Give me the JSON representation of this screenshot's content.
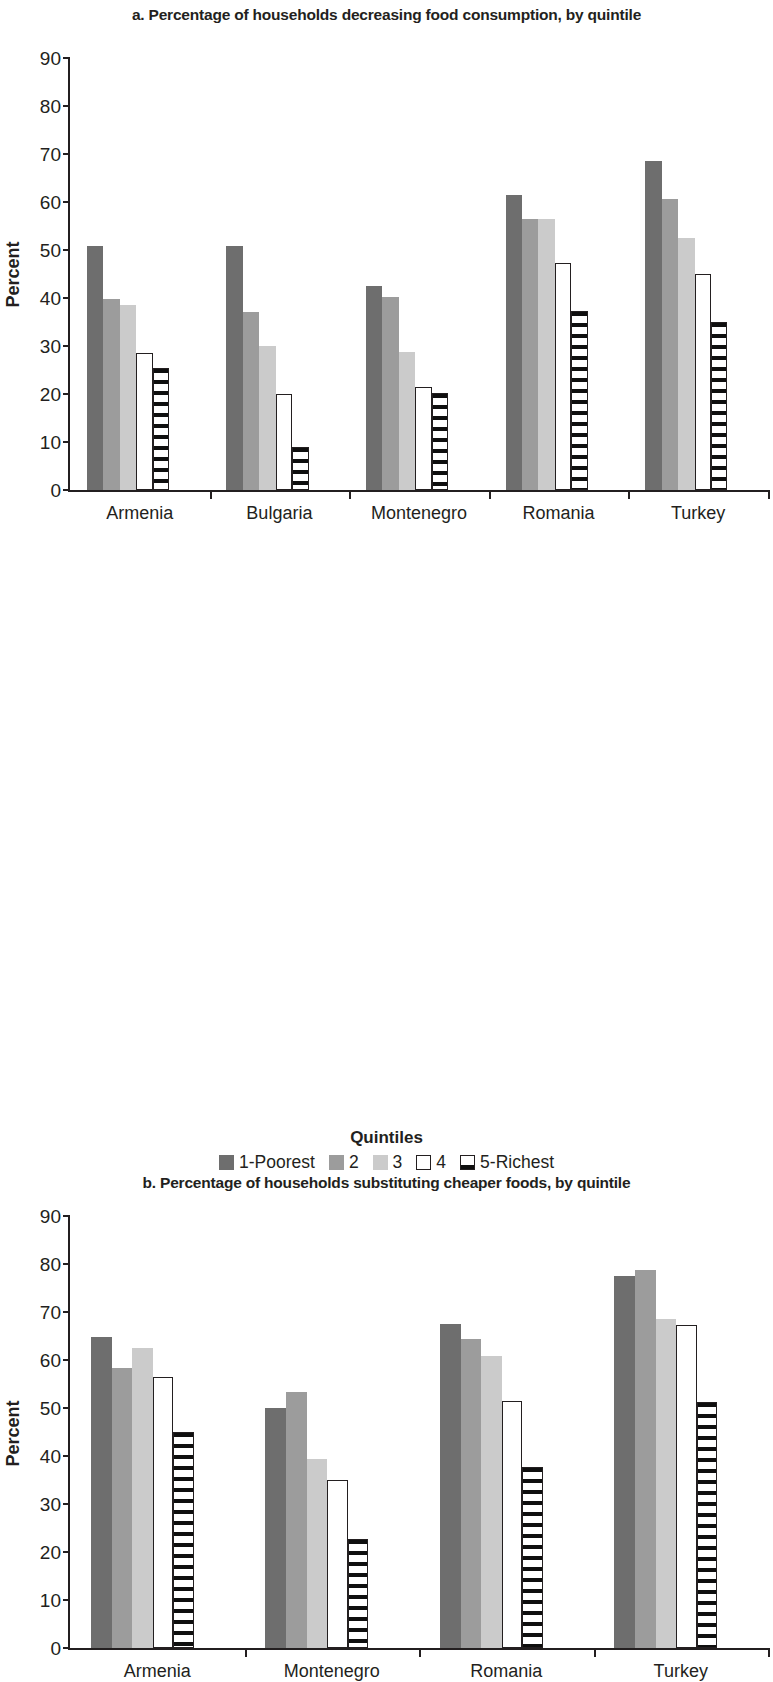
{
  "figure": {
    "panel_a_title": "a. Percentage of households decreasing food consumption, by quintile",
    "panel_b_title": "b. Percentage of households substituting cheaper foods, by quintile",
    "y_axis_title": "Percent",
    "legend_title": "Quintiles",
    "legend_labels": [
      "1-Poorest",
      "2",
      "3",
      "4",
      "5-Richest"
    ],
    "y_ticks": [
      "0",
      "10",
      "20",
      "30",
      "40",
      "50",
      "60",
      "70",
      "80",
      "90"
    ],
    "colors": {
      "series_1": "#6e6e6e",
      "series_2": "#9c9c9c",
      "series_3": "#cbcbcb",
      "series_4": "#ffffff",
      "series_5": "#ffffff",
      "axis": "#231f20",
      "background": "#ffffff"
    }
  },
  "chart_data": [
    {
      "type": "bar",
      "title": "a. Percentage of households decreasing food consumption, by quintile",
      "xlabel": "",
      "ylabel": "Percent",
      "ylim": [
        0,
        90
      ],
      "yticks": [
        0,
        10,
        20,
        30,
        40,
        50,
        60,
        70,
        80,
        90
      ],
      "grid": false,
      "legend_position": "bottom",
      "categories": [
        "Armenia",
        "Bulgaria",
        "Montenegro",
        "Romania",
        "Turkey"
      ],
      "series": [
        {
          "name": "1-Poorest",
          "values": [
            50.8,
            50.8,
            42.5,
            61.5,
            68.6
          ]
        },
        {
          "name": "2",
          "values": [
            39.8,
            37.0,
            40.3,
            56.5,
            60.6
          ]
        },
        {
          "name": "3",
          "values": [
            38.6,
            30.0,
            28.7,
            56.5,
            52.6
          ]
        },
        {
          "name": "4",
          "values": [
            28.6,
            20.0,
            21.5,
            47.2,
            45.0
          ]
        },
        {
          "name": "5-Richest",
          "values": [
            25.4,
            9.0,
            20.3,
            37.2,
            35.0
          ]
        }
      ]
    },
    {
      "type": "bar",
      "title": "b. Percentage of households substituting cheaper foods, by quintile",
      "xlabel": "",
      "ylabel": "Percent",
      "ylim": [
        0,
        90
      ],
      "yticks": [
        0,
        10,
        20,
        30,
        40,
        50,
        60,
        70,
        80,
        90
      ],
      "grid": false,
      "legend_position": "bottom",
      "categories": [
        "Armenia",
        "Montenegro",
        "Romania",
        "Turkey"
      ],
      "series": [
        {
          "name": "1-Poorest",
          "values": [
            64.8,
            50.0,
            67.4,
            77.5
          ]
        },
        {
          "name": "2",
          "values": [
            58.4,
            53.4,
            64.4,
            78.8
          ]
        },
        {
          "name": "3",
          "values": [
            62.6,
            39.4,
            60.8,
            68.5
          ]
        },
        {
          "name": "4",
          "values": [
            56.4,
            35.0,
            51.5,
            67.3
          ]
        },
        {
          "name": "5-Richest",
          "values": [
            45.0,
            22.8,
            37.8,
            51.2
          ]
        }
      ]
    }
  ]
}
